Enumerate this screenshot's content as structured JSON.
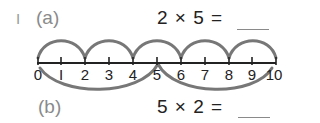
{
  "question_number": "I",
  "parts": [
    {
      "label": "(a)",
      "equation": "2 × 5 =",
      "answer": ""
    },
    {
      "label": "(b)",
      "equation": "5 × 2 =",
      "answer": ""
    }
  ],
  "number_line": {
    "min": 0,
    "max": 10,
    "tick_labels": [
      "0",
      "I",
      "2",
      "3",
      "4",
      "5",
      "6",
      "7",
      "8",
      "9",
      "10"
    ],
    "jumps_above": {
      "size": 2,
      "count": 5,
      "from": [
        0,
        2,
        4,
        6,
        8
      ],
      "to": [
        2,
        4,
        6,
        8,
        10
      ]
    },
    "jumps_below": {
      "size": 5,
      "count": 2,
      "from": [
        0,
        5
      ],
      "to": [
        5,
        10
      ]
    },
    "line_color": "#222222",
    "arc_color": "#777777"
  }
}
